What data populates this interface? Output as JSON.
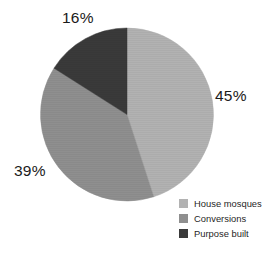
{
  "chart_data": {
    "type": "pie",
    "title": "",
    "categories": [
      "House mosques",
      "Conversions",
      "Purpose built"
    ],
    "values": [
      45,
      39,
      16
    ],
    "value_labels": [
      "45%",
      "39%",
      "16%"
    ],
    "unit": "%",
    "colors": [
      "#b2b2b2",
      "#8f8f8f",
      "#3a3a3a"
    ],
    "legend_position": "bottom-right",
    "start_angle_deg": 0,
    "direction": "clockwise",
    "grid": false,
    "background": "#ffffff",
    "slices": [
      {
        "label": "House mosques",
        "value": 45,
        "display": "45%",
        "color": "#b2b2b2"
      },
      {
        "label": "Conversions",
        "value": 39,
        "display": "39%",
        "color": "#8f8f8f"
      },
      {
        "label": "Purpose built",
        "value": 16,
        "display": "16%",
        "color": "#3a3a3a"
      }
    ]
  },
  "labels": {
    "house_mosques_pct": "45%",
    "conversions_pct": "39%",
    "purpose_built_pct": "16%"
  },
  "legend": {
    "items": [
      {
        "label": "House mosques",
        "color": "#b2b2b2"
      },
      {
        "label": "Conversions",
        "color": "#8f8f8f"
      },
      {
        "label": "Purpose built",
        "color": "#3a3a3a"
      }
    ]
  }
}
